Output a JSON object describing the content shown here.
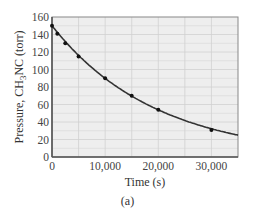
{
  "chart_data": {
    "type": "line",
    "title": "",
    "xlabel": "Time (s)",
    "ylabel": "Pressure, CH3NC (torr)",
    "ylabel_parts": {
      "pre": "Pressure, CH",
      "sub": "3",
      "post": "NC (torr)"
    },
    "xlim": [
      0,
      35000
    ],
    "ylim": [
      0,
      160
    ],
    "grid": true,
    "x_ticks": [
      0,
      10000,
      20000,
      30000
    ],
    "x_tick_labels": [
      "0",
      "10,000",
      "20,000",
      "30,000"
    ],
    "y_ticks": [
      0,
      20,
      40,
      60,
      80,
      100,
      120,
      140,
      160
    ],
    "y_tick_labels": [
      "0",
      "20",
      "40",
      "60",
      "80",
      "100",
      "120",
      "140",
      "160"
    ],
    "series": [
      {
        "name": "CH3NC pressure (measured)",
        "marker": "dot",
        "x": [
          0,
          1000,
          2500,
          5000,
          10000,
          15000,
          20000,
          30000
        ],
        "values": [
          150,
          141,
          130,
          115,
          90,
          70,
          54,
          31
        ]
      },
      {
        "name": "Exponential fit",
        "style": "curve",
        "initial": 150,
        "rate_constant_per_s": 5.12e-05,
        "x_range": [
          0,
          35000
        ]
      }
    ],
    "colors": {
      "plot_bg": "#eeeeee",
      "grid": "#d0d0d0",
      "axis": "#555555",
      "curve": "#333333",
      "marker": "#111111"
    }
  },
  "caption": "(a)"
}
